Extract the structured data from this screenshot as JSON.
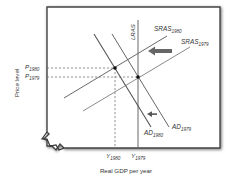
{
  "diagram": {
    "y_axis_label": "Price level",
    "x_axis_label": "Real GDP per year",
    "curves": {
      "lras": {
        "label": "LRAS"
      },
      "sras_1980": {
        "label": "SRAS",
        "subscript": "1980"
      },
      "sras_1979": {
        "label": "SRAS",
        "subscript": "1979"
      },
      "ad_1980": {
        "label": "AD",
        "subscript": "1980"
      },
      "ad_1979": {
        "label": "AD",
        "subscript": "1979"
      }
    },
    "price_ticks": [
      {
        "label": "P",
        "subscript": "1980"
      },
      {
        "label": "P",
        "subscript": "1979"
      }
    ],
    "output_ticks": [
      {
        "label": "Y",
        "subscript": "1980"
      },
      {
        "label": "Y",
        "subscript": "1979"
      }
    ],
    "arrows": [
      {
        "name": "sras-shift-arrow",
        "direction": "left"
      },
      {
        "name": "ad-shift-arrow",
        "direction": "left"
      }
    ],
    "colors": {
      "line_dark": "#555555",
      "line_light": "#7a7a7a",
      "frame": "#444444",
      "text": "#333333"
    }
  }
}
